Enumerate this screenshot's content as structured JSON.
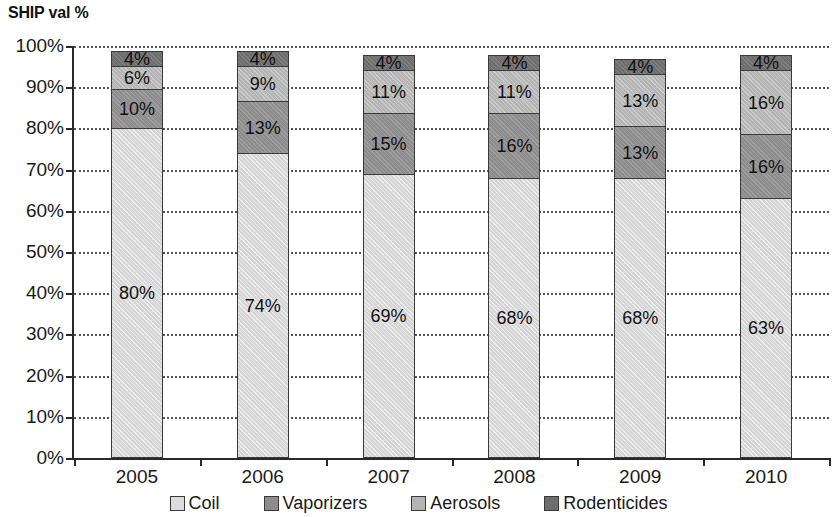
{
  "chart_data": {
    "type": "bar",
    "stacked": true,
    "title": "SHIP val %",
    "xlabel": "",
    "ylabel": "",
    "ylim": [
      0,
      100
    ],
    "y_tick_labels": [
      "0%",
      "10%",
      "20%",
      "30%",
      "40%",
      "50%",
      "60%",
      "70%",
      "80%",
      "90%",
      "100%"
    ],
    "y_tick_values": [
      0,
      10,
      20,
      30,
      40,
      50,
      60,
      70,
      80,
      90,
      100
    ],
    "grid": "horizontal-dotted",
    "legend_position": "bottom",
    "categories": [
      "2005",
      "2006",
      "2007",
      "2008",
      "2009",
      "2010"
    ],
    "series": [
      {
        "name": "Coil",
        "color": "#d5d5d5",
        "values": [
          80,
          74,
          69,
          68,
          68,
          63
        ],
        "labels": [
          "80%",
          "74%",
          "69%",
          "68%",
          "68%",
          "63%"
        ]
      },
      {
        "name": "Vaporizers",
        "color": "#8d8d8d",
        "values": [
          10,
          13,
          15,
          16,
          13,
          16
        ],
        "labels": [
          "10%",
          "13%",
          "15%",
          "16%",
          "13%",
          "16%"
        ]
      },
      {
        "name": "Aerosols",
        "color": "#b4b4b4",
        "values": [
          6,
          9,
          11,
          11,
          13,
          16
        ],
        "labels": [
          "6%",
          "9%",
          "11%",
          "11%",
          "13%",
          "16%"
        ]
      },
      {
        "name": "Rodenticides",
        "color": "#6e6e6e",
        "values": [
          4,
          4,
          4,
          4,
          4,
          4
        ],
        "labels": [
          "4%",
          "4%",
          "4%",
          "4%",
          "4%",
          "4%"
        ]
      }
    ],
    "column_totals": [
      100,
      100,
      99,
      99,
      98,
      99
    ]
  },
  "legend": {
    "items": [
      {
        "label": "Coil",
        "key": "coil"
      },
      {
        "label": "Vaporizers",
        "key": "vaporizers"
      },
      {
        "label": "Aerosols",
        "key": "aerosols"
      },
      {
        "label": "Rodenticides",
        "key": "rodenticides"
      }
    ]
  }
}
